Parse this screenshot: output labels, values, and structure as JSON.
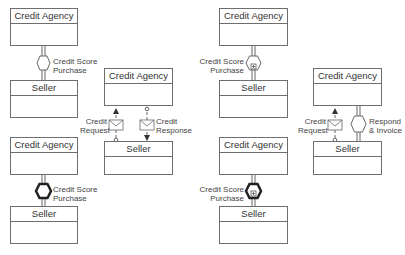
{
  "diagrams": [
    {
      "id": "top-left",
      "agency": "Credit Agency",
      "seller": "Seller",
      "conversation": {
        "type": "conversation",
        "label_line1": "Credit Score",
        "label_line2": "Purchase"
      }
    },
    {
      "id": "bottom-left",
      "agency": "Credit Agency",
      "seller": "Seller",
      "conversation": {
        "type": "call-conversation",
        "label_line1": "Credit Score",
        "label_line2": "Purchase"
      }
    },
    {
      "id": "middle",
      "agency": "Credit Agency",
      "seller": "Seller",
      "messages": [
        {
          "label_line1": "Credit",
          "label_line2": "Request"
        },
        {
          "label_line1": "Credit",
          "label_line2": "Response"
        }
      ]
    },
    {
      "id": "top-right",
      "agency": "Credit Agency",
      "seller": "Seller",
      "conversation": {
        "type": "sub-conversation",
        "label_line1": "Credit Score",
        "label_line2": "Purchase"
      }
    },
    {
      "id": "bottom-right",
      "agency": "Credit Agency",
      "seller": "Seller",
      "conversation": {
        "type": "call-sub-conversation",
        "label_line1": "Credit Score",
        "label_line2": "Purchase"
      }
    },
    {
      "id": "far-right",
      "agency": "Credit Agency",
      "seller": "Seller",
      "message": {
        "label_line1": "Credit",
        "label_line2": "Request"
      },
      "conversation": {
        "type": "conversation",
        "label_line1": "Respond",
        "label_line2": "& Invoice"
      }
    }
  ],
  "colors": {
    "stroke": "#555555",
    "line": "#777777",
    "text": "#333333"
  }
}
